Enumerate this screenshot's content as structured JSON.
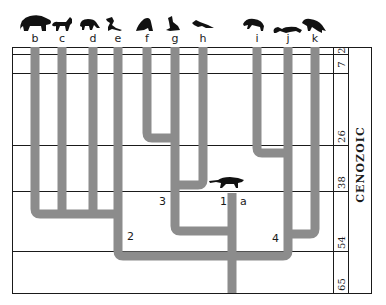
{
  "diagram": {
    "type": "phylogenetic-tree",
    "era": "CENOZOIC",
    "time_scale_ma": [
      "2",
      "7",
      "26",
      "38",
      "54",
      "65"
    ],
    "taxa": [
      {
        "id": "b",
        "label": "b",
        "silhouette": "bear"
      },
      {
        "id": "c",
        "label": "c",
        "silhouette": "fox"
      },
      {
        "id": "d",
        "label": "d",
        "silhouette": "raccoon"
      },
      {
        "id": "e",
        "label": "e",
        "silhouette": "weasel"
      },
      {
        "id": "f",
        "label": "f",
        "silhouette": "walrus"
      },
      {
        "id": "g",
        "label": "g",
        "silhouette": "sea-lion"
      },
      {
        "id": "h",
        "label": "h",
        "silhouette": "seal"
      },
      {
        "id": "i",
        "label": "i",
        "silhouette": "hyena"
      },
      {
        "id": "j",
        "label": "j",
        "silhouette": "mongoose"
      },
      {
        "id": "k",
        "label": "k",
        "silhouette": "cat"
      }
    ],
    "ancestor": {
      "label": "a",
      "silhouette": "miacid"
    },
    "nodes": [
      {
        "id": "1",
        "label": "1"
      },
      {
        "id": "2",
        "label": "2"
      },
      {
        "id": "3",
        "label": "3"
      },
      {
        "id": "4",
        "label": "4"
      }
    ],
    "colors": {
      "branch": "#8c8c8c",
      "grid": "#1a1a1a",
      "silhouette": "#111111"
    }
  }
}
